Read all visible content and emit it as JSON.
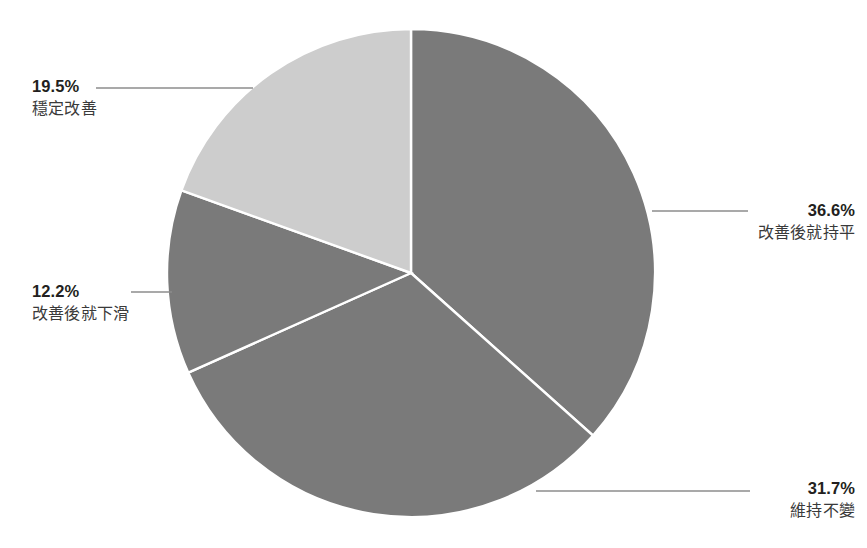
{
  "chart_data": {
    "type": "pie",
    "title": "",
    "subtitle": "",
    "xlabel": "",
    "ylabel": "",
    "legend_position": "none",
    "grid": false,
    "units": "%",
    "start_angle_deg": 0,
    "direction": "clockwise",
    "categories": [
      "改善後就持平",
      "維持不變",
      "改善後就下滑",
      "穩定改善"
    ],
    "values": [
      36.6,
      31.7,
      12.2,
      19.5
    ],
    "value_labels": [
      "36.6%",
      "31.7%",
      "12.2%",
      "19.5%"
    ],
    "colors": [
      "#7a7a7a",
      "#7a7a7a",
      "#7a7a7a",
      "#cdcdcd"
    ],
    "slice_separator_color": "#ffffff",
    "slices": [
      {
        "label": "改善後就持平",
        "value": 36.6,
        "value_label": "36.6%",
        "color": "#7a7a7a"
      },
      {
        "label": "維持不變",
        "value": 31.7,
        "value_label": "31.7%",
        "color": "#7a7a7a"
      },
      {
        "label": "改善後就下滑",
        "value": 12.2,
        "value_label": "12.2%",
        "color": "#7a7a7a"
      },
      {
        "label": "穩定改善",
        "value": 19.5,
        "value_label": "19.5%",
        "color": "#cdcdcd"
      }
    ]
  },
  "callouts": {
    "stable": {
      "pct": "19.5%",
      "cat": "穩定改善"
    },
    "decline": {
      "pct": "12.2%",
      "cat": "改善後就下滑"
    },
    "plateau": {
      "pct": "36.6%",
      "cat": "改善後就持平"
    },
    "unchanged": {
      "pct": "31.7%",
      "cat": "維持不變"
    }
  },
  "style": {
    "background": "#ffffff",
    "dark_gray": "#7a7a7a",
    "light_gray": "#cdcdcd",
    "leader_line_color": "#8c8c8c",
    "text_color": "#231f20"
  }
}
